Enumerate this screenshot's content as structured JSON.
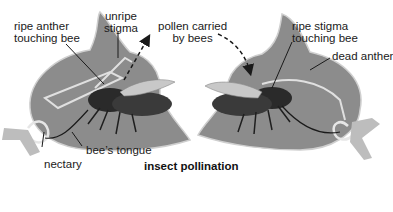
{
  "figure": {
    "caption": "insect pollination",
    "colors": {
      "flower_body": "#8c8c8c",
      "flower_outline": "#d9d9d9",
      "stem": "#bdbdbd",
      "bee_dark": "#2a2a2a",
      "wing": "#c8c8c8",
      "text": "#1a1a1a",
      "background": "#ffffff"
    }
  },
  "left_flower": {
    "labels": {
      "ripe_anther_line1": "ripe anther",
      "ripe_anther_line2": "touching bee",
      "unripe_stigma_line1": "unripe",
      "unripe_stigma_line2": "stigma",
      "nectary": "nectary",
      "bees_tongue": "bee’s tongue"
    }
  },
  "center": {
    "pollen_line1": "pollen carried",
    "pollen_line2": "by bees"
  },
  "right_flower": {
    "labels": {
      "ripe_stigma_line1": "ripe stigma",
      "ripe_stigma_line2": "touching bee",
      "dead_anther": "dead anther"
    }
  }
}
